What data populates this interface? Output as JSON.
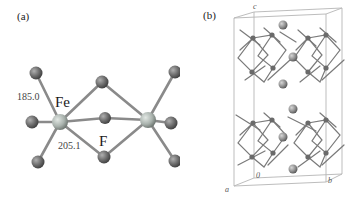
{
  "figure": {
    "panel_a": {
      "label": "(a)",
      "atoms": {
        "metal": "Fe",
        "ligand": "F"
      },
      "bond_lengths": {
        "terminal": "185.0",
        "bridging": "205.1"
      },
      "colors": {
        "bond": "#8a8a8a",
        "fe_atom": "#a9b2ad",
        "f_atom": "#6e6e6e"
      }
    },
    "panel_b": {
      "label": "(b)",
      "axes": {
        "a": "a",
        "b": "b",
        "c": "c",
        "origin": "0"
      },
      "colors": {
        "cell_edge": "#b5b5b5",
        "framework": "#7a7a7a",
        "cation": "#8e8e8e"
      }
    }
  }
}
